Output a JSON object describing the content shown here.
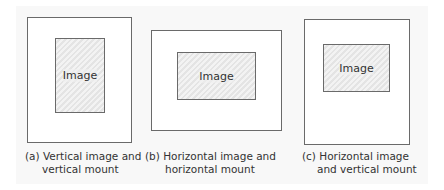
{
  "figure": {
    "panels": [
      {
        "id": "a",
        "image_label": "Image",
        "caption_line1": "(a) Vertical image and",
        "caption_line2": "vertical mount",
        "mount_orientation": "vertical",
        "image_orientation": "vertical"
      },
      {
        "id": "b",
        "image_label": "Image",
        "caption_line1": "(b) Horizontal image and",
        "caption_line2": "horizontal mount",
        "mount_orientation": "horizontal",
        "image_orientation": "horizontal"
      },
      {
        "id": "c",
        "image_label": "Image",
        "caption_line1": "(c) Horizontal image",
        "caption_line2": "and vertical mount",
        "mount_orientation": "vertical",
        "image_orientation": "horizontal"
      }
    ],
    "colors": {
      "mount_border": "#6a6a6a",
      "image_fill": "#e4e4e4",
      "background": "#f8f8f8"
    }
  }
}
